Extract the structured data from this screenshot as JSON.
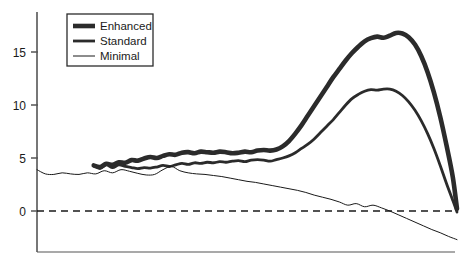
{
  "chart_data": {
    "type": "line",
    "title": "",
    "subtitle": "",
    "xlabel": "",
    "ylabel": "",
    "xlim": [
      0,
      100
    ],
    "ylim": [
      -3.2,
      18.2
    ],
    "grid": false,
    "y_ticks": [
      0,
      5,
      10,
      15
    ],
    "y_tick_labels": [
      "0",
      "5",
      "10",
      "15"
    ],
    "x_ticks": [],
    "x_tick_labels": [],
    "zero_line": {
      "value": 0,
      "style": "dashed",
      "color": "#1a1a1a"
    },
    "legend": {
      "position": "top-left",
      "entries": [
        "Enhanced",
        "Standard",
        "Minimal"
      ]
    },
    "axis_color": "#555555",
    "series": [
      {
        "name": "Enhanced",
        "color": "#2b2b2b",
        "line_width": 4.6,
        "x": [
          13.5,
          15,
          16.5,
          18,
          19.5,
          21,
          22.5,
          24,
          25.5,
          27,
          28.5,
          30,
          31.5,
          33,
          34.5,
          36,
          37.5,
          39,
          40.5,
          42,
          43.5,
          45,
          46.5,
          48,
          49.5,
          51,
          52.5,
          54,
          55.5,
          57,
          58.5,
          60,
          61.5,
          63,
          64.5,
          66,
          67.5,
          69,
          70.5,
          72,
          73.5,
          75,
          76.5,
          78,
          79.5,
          81,
          82.5,
          84,
          85.5,
          87,
          88.5,
          90,
          91.5,
          93,
          94.5,
          96,
          97.5,
          99,
          100
        ],
        "values": [
          4.3,
          4.15,
          4.45,
          4.35,
          4.6,
          4.55,
          4.8,
          4.75,
          4.95,
          5.1,
          5.0,
          5.2,
          5.35,
          5.3,
          5.5,
          5.55,
          5.45,
          5.6,
          5.55,
          5.5,
          5.6,
          5.55,
          5.45,
          5.5,
          5.6,
          5.55,
          5.7,
          5.75,
          5.7,
          5.8,
          6.1,
          6.6,
          7.3,
          8.1,
          9.0,
          9.9,
          10.8,
          11.7,
          12.6,
          13.4,
          14.2,
          14.9,
          15.5,
          16.0,
          16.3,
          16.45,
          16.35,
          16.55,
          16.8,
          16.75,
          16.4,
          15.7,
          14.6,
          13.1,
          11.2,
          8.9,
          6.2,
          3.2,
          0.2
        ]
      },
      {
        "name": "Standard",
        "color": "#2b2b2b",
        "line_width": 2.8,
        "x": [
          13.5,
          15,
          16.5,
          18,
          19.5,
          21,
          22.5,
          24,
          25.5,
          27,
          28.5,
          30,
          31.5,
          33,
          34.5,
          36,
          37.5,
          39,
          40.5,
          42,
          43.5,
          45,
          46.5,
          48,
          49.5,
          51,
          52.5,
          54,
          55.5,
          57,
          58.5,
          60,
          61.5,
          63,
          64.5,
          66,
          67.5,
          69,
          70.5,
          72,
          73.5,
          75,
          76.5,
          78,
          79.5,
          81,
          82.5,
          84,
          85.5,
          87,
          88.5,
          90,
          91.5,
          93,
          94.5,
          96,
          97.5,
          99,
          100
        ],
        "values": [
          4.3,
          4.0,
          4.35,
          4.1,
          4.35,
          4.2,
          4.1,
          4.0,
          4.1,
          4.05,
          4.15,
          4.3,
          4.2,
          4.35,
          4.5,
          4.4,
          4.55,
          4.5,
          4.6,
          4.55,
          4.65,
          4.6,
          4.7,
          4.75,
          4.65,
          4.8,
          4.85,
          4.8,
          4.7,
          4.85,
          5.0,
          5.2,
          5.5,
          5.9,
          6.3,
          6.8,
          7.4,
          8.0,
          8.6,
          9.3,
          10.0,
          10.6,
          11.0,
          11.3,
          11.45,
          11.4,
          11.5,
          11.5,
          11.3,
          10.9,
          10.3,
          9.5,
          8.5,
          7.3,
          5.9,
          4.3,
          2.6,
          1.0,
          -0.1
        ]
      },
      {
        "name": "Minimal",
        "color": "#1a1a1a",
        "line_width": 1.0,
        "x": [
          0,
          2,
          4,
          6,
          8,
          10,
          12,
          14,
          16,
          18,
          20,
          22,
          24,
          26,
          28,
          30,
          32,
          34,
          36,
          38,
          40,
          42,
          44,
          46,
          48,
          50,
          52,
          54,
          56,
          58,
          60,
          62,
          64,
          66,
          68,
          70,
          72,
          74,
          76,
          78,
          80,
          82,
          84,
          86,
          88,
          90,
          92,
          94,
          96,
          98,
          100
        ],
        "values": [
          3.9,
          3.5,
          3.45,
          3.6,
          3.5,
          3.45,
          3.6,
          3.5,
          3.8,
          3.6,
          3.9,
          3.75,
          3.55,
          3.4,
          3.45,
          3.9,
          4.2,
          3.8,
          3.6,
          3.5,
          3.45,
          3.35,
          3.25,
          3.1,
          2.95,
          2.8,
          2.7,
          2.55,
          2.4,
          2.25,
          2.1,
          1.95,
          1.75,
          1.5,
          1.3,
          1.1,
          0.85,
          0.55,
          0.7,
          0.4,
          0.55,
          0.3,
          0.0,
          -0.35,
          -0.7,
          -1.05,
          -1.4,
          -1.75,
          -2.05,
          -2.4,
          -2.7
        ]
      }
    ]
  },
  "axes": {
    "y_axis_name": "value-axis",
    "x_axis_name": "category-axis"
  }
}
